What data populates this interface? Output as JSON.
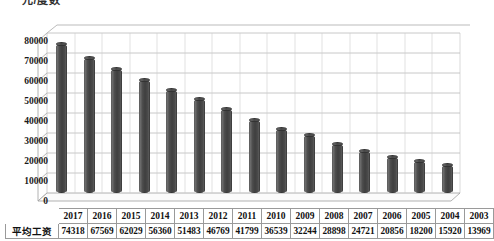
{
  "chart_title": "元/度数",
  "axis": {
    "y_ticks": [
      "80000",
      "70000",
      "60000",
      "50000",
      "40000",
      "30000",
      "20000",
      "10000",
      "0"
    ]
  },
  "table": {
    "corner_label": "",
    "row_label": "平均工资",
    "years": [
      "2017",
      "2016",
      "2015",
      "2014",
      "2013",
      "2012",
      "2011",
      "2010",
      "2009",
      "2008",
      "2007",
      "2006",
      "2005",
      "2004",
      "2003"
    ],
    "values": [
      "74318",
      "67569",
      "62029",
      "56360",
      "51483",
      "46769",
      "41799",
      "36539",
      "32244",
      "28898",
      "24721",
      "20856",
      "18200",
      "15920",
      "13969"
    ]
  },
  "chart_data": {
    "type": "bar",
    "title": "元/度数",
    "xlabel": "",
    "ylabel": "",
    "ylim": [
      0,
      80000
    ],
    "grid": true,
    "legend": "none",
    "three_d": true,
    "series_name": "平均工资",
    "categories": [
      "2017",
      "2016",
      "2015",
      "2014",
      "2013",
      "2012",
      "2011",
      "2010",
      "2009",
      "2008",
      "2007",
      "2006",
      "2005",
      "2004",
      "2003"
    ],
    "values": [
      74318,
      67569,
      62029,
      56360,
      51483,
      46769,
      41799,
      36539,
      32244,
      28898,
      24721,
      20856,
      18200,
      15920,
      13969
    ],
    "ytick_labels": [
      "0",
      "10000",
      "20000",
      "30000",
      "40000",
      "50000",
      "60000",
      "70000",
      "80000"
    ],
    "colors": {
      "bar": "#4a4a4a",
      "grid": "#b8b8b8",
      "text": "#111111"
    }
  }
}
